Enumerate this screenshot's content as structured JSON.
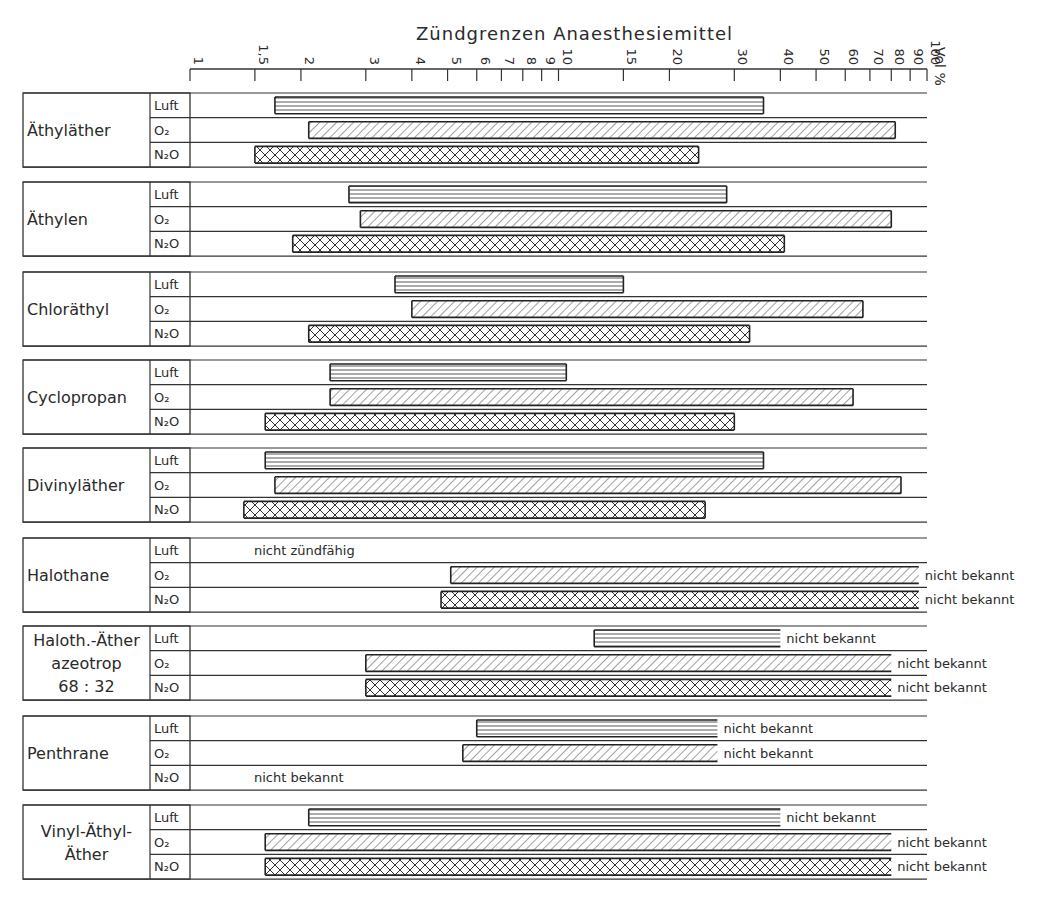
{
  "chart_data": {
    "type": "bar",
    "subtype": "horizontal-range-log",
    "title": "Zündgrenzen Anaesthesiemittel",
    "xlabel": "Vol %",
    "xscale": "log",
    "xlim": [
      1,
      100
    ],
    "xticks": [
      {
        "value": 1,
        "label": "1"
      },
      {
        "value": 1.5,
        "label": "1,5"
      },
      {
        "value": 2,
        "label": "2"
      },
      {
        "value": 3,
        "label": "3"
      },
      {
        "value": 4,
        "label": "4"
      },
      {
        "value": 5,
        "label": "5"
      },
      {
        "value": 6,
        "label": "6"
      },
      {
        "value": 7,
        "label": "7"
      },
      {
        "value": 8,
        "label": "8"
      },
      {
        "value": 9,
        "label": "9"
      },
      {
        "value": 10,
        "label": "10"
      },
      {
        "value": 15,
        "label": "15"
      },
      {
        "value": 20,
        "label": "20"
      },
      {
        "value": 30,
        "label": "30"
      },
      {
        "value": 40,
        "label": "40"
      },
      {
        "value": 50,
        "label": "50"
      },
      {
        "value": 60,
        "label": "60"
      },
      {
        "value": 70,
        "label": "70"
      },
      {
        "value": 80,
        "label": "80"
      },
      {
        "value": 90,
        "label": "90"
      },
      {
        "value": 100,
        "label": "100"
      }
    ],
    "legend": [
      {
        "key": "Luft",
        "label": "Luft",
        "pattern": "horizontal-lines"
      },
      {
        "key": "O2",
        "label": "O₂",
        "pattern": "diagonal-hatch"
      },
      {
        "key": "N2O",
        "label": "N₂O",
        "pattern": "cross-hatch"
      }
    ],
    "groups": [
      {
        "name": "Äthyläther",
        "name_lines": [
          "Äthyläther"
        ],
        "rows": [
          {
            "medium": "Luft",
            "low": 1.7,
            "high": 36
          },
          {
            "medium": "O2",
            "low": 2.1,
            "high": 82
          },
          {
            "medium": "N2O",
            "low": 1.5,
            "high": 24
          }
        ]
      },
      {
        "name": "Äthylen",
        "name_lines": [
          "Äthylen"
        ],
        "rows": [
          {
            "medium": "Luft",
            "low": 2.7,
            "high": 28.6
          },
          {
            "medium": "O2",
            "low": 2.9,
            "high": 80
          },
          {
            "medium": "N2O",
            "low": 1.9,
            "high": 41
          }
        ]
      },
      {
        "name": "Chloräthyl",
        "name_lines": [
          "Chloräthyl"
        ],
        "rows": [
          {
            "medium": "Luft",
            "low": 3.6,
            "high": 15
          },
          {
            "medium": "O2",
            "low": 4.0,
            "high": 67
          },
          {
            "medium": "N2O",
            "low": 2.1,
            "high": 33
          }
        ]
      },
      {
        "name": "Cyclopropan",
        "name_lines": [
          "Cyclopropan"
        ],
        "rows": [
          {
            "medium": "Luft",
            "low": 2.4,
            "high": 10.5
          },
          {
            "medium": "O2",
            "low": 2.4,
            "high": 63
          },
          {
            "medium": "N2O",
            "low": 1.6,
            "high": 30
          }
        ]
      },
      {
        "name": "Divinyläther",
        "name_lines": [
          "Divinyläther"
        ],
        "rows": [
          {
            "medium": "Luft",
            "low": 1.6,
            "high": 36
          },
          {
            "medium": "O2",
            "low": 1.7,
            "high": 85
          },
          {
            "medium": "N2O",
            "low": 1.4,
            "high": 25
          }
        ]
      },
      {
        "name": "Halothane",
        "name_lines": [
          "Halothane"
        ],
        "rows": [
          {
            "medium": "Luft",
            "low": null,
            "high": null,
            "note": "nicht zündfähig"
          },
          {
            "medium": "O2",
            "low": 5.1,
            "high": null,
            "open_to": 95,
            "note": "nicht bekannt"
          },
          {
            "medium": "N2O",
            "low": 4.8,
            "high": null,
            "open_to": 95,
            "note": "nicht bekannt"
          }
        ]
      },
      {
        "name": "Haloth.-Äther azeotrop 68 : 32",
        "name_lines": [
          "Haloth.-Äther",
          "azeotrop",
          "68 : 32"
        ],
        "rows": [
          {
            "medium": "Luft",
            "low": 12.5,
            "high": null,
            "open_to": 40,
            "note": "nicht bekannt"
          },
          {
            "medium": "O2",
            "low": 3.0,
            "high": null,
            "open_to": 80,
            "note": "nicht bekannt"
          },
          {
            "medium": "N2O",
            "low": 3.0,
            "high": null,
            "open_to": 80,
            "note": "nicht bekannt"
          }
        ]
      },
      {
        "name": "Penthrane",
        "name_lines": [
          "Penthrane"
        ],
        "rows": [
          {
            "medium": "Luft",
            "low": 6.0,
            "high": null,
            "open_to": 27,
            "note": "nicht bekannt"
          },
          {
            "medium": "O2",
            "low": 5.5,
            "high": null,
            "open_to": 27,
            "note": "nicht bekannt"
          },
          {
            "medium": "N2O",
            "low": null,
            "high": null,
            "note": "nicht bekannt"
          }
        ]
      },
      {
        "name": "Vinyl-Äthyl-Äther",
        "name_lines": [
          "Vinyl-Äthyl-",
          "Äther"
        ],
        "rows": [
          {
            "medium": "Luft",
            "low": 2.1,
            "high": null,
            "open_to": 40,
            "note": "nicht bekannt"
          },
          {
            "medium": "O2",
            "low": 1.6,
            "high": null,
            "open_to": 80,
            "note": "nicht bekannt"
          },
          {
            "medium": "N2O",
            "low": 1.6,
            "high": null,
            "open_to": 80,
            "note": "nicht bekannt"
          }
        ]
      }
    ]
  }
}
